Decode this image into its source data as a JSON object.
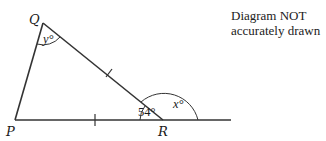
{
  "note": {
    "line1": "Diagram NOT",
    "line2": "accurately drawn"
  },
  "vertices": {
    "P": {
      "label": "P"
    },
    "Q": {
      "label": "Q"
    },
    "R": {
      "label": "R"
    }
  },
  "angles": {
    "Q": "y°",
    "R_interior": "54°",
    "R_exterior": "x°"
  },
  "markings": {
    "equal_sides": [
      "QR",
      "PR"
    ]
  },
  "colors": {
    "line": "#333333",
    "text": "#1a1a1a"
  }
}
